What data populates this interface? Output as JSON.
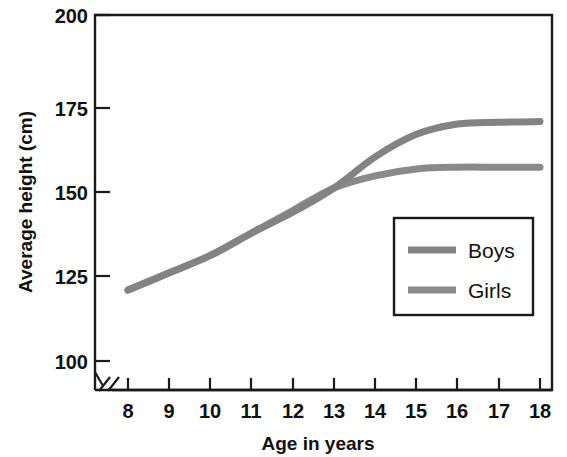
{
  "chart_data": {
    "type": "line",
    "title": "",
    "xlabel": "Age in years",
    "ylabel": "Average height (cm)",
    "x": [
      8,
      9,
      10,
      11,
      12,
      13,
      14,
      15,
      16,
      17,
      18
    ],
    "xlim": [
      8,
      18
    ],
    "ylim": [
      100,
      200
    ],
    "xticks": [
      "8",
      "9",
      "10",
      "11",
      "12",
      "13",
      "14",
      "15",
      "16",
      "17",
      "18"
    ],
    "yticks": [
      "100",
      "125",
      "150",
      "175",
      "200"
    ],
    "grid": false,
    "axis_break": true,
    "axis_break_note": "y-axis broken below 100 cm",
    "legend_position": "inside lower-right",
    "series": [
      {
        "name": "Boys",
        "color": "#838383",
        "values": [
          120.5,
          125.5,
          130.5,
          137.0,
          143.0,
          150.0,
          159.0,
          165.5,
          168.5,
          169.0,
          169.2
        ]
      },
      {
        "name": "Girls",
        "color": "#8a8a8a",
        "values": [
          120.5,
          125.5,
          130.5,
          137.0,
          143.5,
          150.0,
          153.5,
          155.5,
          156.0,
          156.0,
          156.0
        ]
      }
    ]
  },
  "axes": {
    "y_title": "Average height (cm)",
    "x_title": "Age in years",
    "y_tick_labels": [
      "200",
      "175",
      "150",
      "125",
      "100"
    ],
    "x_tick_labels": [
      "8",
      "9",
      "10",
      "11",
      "12",
      "13",
      "14",
      "15",
      "16",
      "17",
      "18"
    ]
  },
  "legend": {
    "entries": [
      {
        "label": "Boys",
        "color": "#838383"
      },
      {
        "label": "Girls",
        "color": "#8a8a8a"
      }
    ]
  },
  "colors": {
    "axis": "#1a1a1a",
    "text": "#111111",
    "boys_line": "#838383",
    "girls_line": "#8a8a8a",
    "background": "#ffffff"
  }
}
